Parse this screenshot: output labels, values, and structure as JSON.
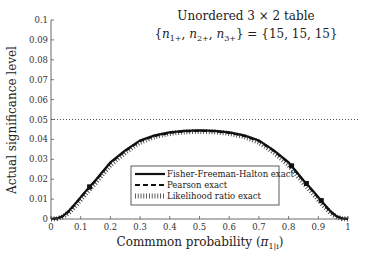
{
  "chart_data": {
    "type": "line",
    "title": "Unordered 3 × 2 table",
    "subtitle": "{n1+, n2+, n3+} = {15, 15, 15}",
    "xlabel": "Commmon probability (π1|i)",
    "ylabel": "Actual significance level",
    "xlim": [
      0,
      1
    ],
    "ylim": [
      0,
      0.1
    ],
    "xticks": [
      "0",
      "0.1",
      "0.2",
      "0.3",
      "0.4",
      "0.5",
      "0.6",
      "0.7",
      "0.8",
      "0.9",
      "1"
    ],
    "yticks": [
      "0",
      "0.01",
      "0.02",
      "0.03",
      "0.04",
      "0.05",
      "0.06",
      "0.07",
      "0.08",
      "0.09",
      "0.1"
    ],
    "grid": false,
    "reference_line": {
      "y": 0.05,
      "style": "dotted"
    },
    "legend_position": "lower center",
    "x": [
      0,
      0.02,
      0.04,
      0.06,
      0.08,
      0.1,
      0.12,
      0.15,
      0.2,
      0.25,
      0.3,
      0.35,
      0.4,
      0.45,
      0.5,
      0.55,
      0.6,
      0.65,
      0.7,
      0.75,
      0.8,
      0.85,
      0.88,
      0.9,
      0.92,
      0.94,
      0.96,
      0.98,
      1.0
    ],
    "series": [
      {
        "name": "Fisher-Freeman-Halton exact",
        "style": "solid",
        "values": [
          0,
          0.0003,
          0.0015,
          0.004,
          0.0075,
          0.011,
          0.0145,
          0.0195,
          0.0285,
          0.0345,
          0.0395,
          0.042,
          0.0435,
          0.0443,
          0.0445,
          0.0443,
          0.0435,
          0.042,
          0.0395,
          0.0345,
          0.0285,
          0.0195,
          0.0145,
          0.011,
          0.0075,
          0.004,
          0.0015,
          0.0003,
          0
        ]
      },
      {
        "name": "Pearson exact",
        "style": "dashed",
        "values": [
          0,
          0.0003,
          0.0014,
          0.0038,
          0.0072,
          0.0107,
          0.0142,
          0.0192,
          0.0282,
          0.0342,
          0.0392,
          0.0418,
          0.0433,
          0.0441,
          0.0443,
          0.0441,
          0.0433,
          0.0418,
          0.0392,
          0.0342,
          0.0282,
          0.0192,
          0.0142,
          0.0107,
          0.0072,
          0.0038,
          0.0014,
          0.0003,
          0
        ]
      },
      {
        "name": "Likelihood ratio exact",
        "style": "vertical-hatch",
        "values": [
          0,
          0.0002,
          0.0011,
          0.0032,
          0.0064,
          0.0098,
          0.0132,
          0.0182,
          0.0272,
          0.0335,
          0.0386,
          0.0414,
          0.043,
          0.0438,
          0.044,
          0.0438,
          0.043,
          0.0414,
          0.0386,
          0.0335,
          0.0272,
          0.0182,
          0.0132,
          0.0098,
          0.0064,
          0.0032,
          0.0011,
          0.0002,
          0
        ]
      }
    ]
  },
  "colors": {
    "line": "#111111",
    "axis": "#444444",
    "background": "#ffffff"
  }
}
